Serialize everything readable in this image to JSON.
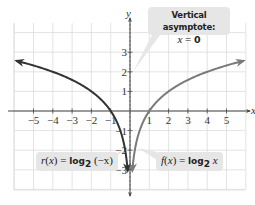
{
  "chart_data": {
    "type": "line",
    "title": "",
    "xlabel": "x",
    "ylabel": "y",
    "xlim": [
      -6,
      6
    ],
    "ylim": [
      -4,
      4
    ],
    "grid": true,
    "x_ticks": [
      -5,
      -4,
      -3,
      -2,
      -1,
      1,
      2,
      3,
      4,
      5
    ],
    "y_ticks": [
      -3,
      -2,
      -1,
      1,
      2,
      3
    ],
    "x_tick_labels": [
      "−5",
      "−4",
      "−3",
      "−2",
      "−1",
      "1",
      "2",
      "3",
      "4",
      "5"
    ],
    "y_tick_labels": [
      "−3",
      "−2",
      "−1",
      "1",
      "2",
      "3"
    ],
    "series": [
      {
        "name": "r(x) = log2(−x)",
        "color": "#333333",
        "x": [
          -5.9,
          -5,
          -4,
          -3,
          -2,
          -1,
          -0.5,
          -0.25,
          -0.125
        ],
        "y": [
          2.56,
          2.32,
          2,
          1.58,
          1,
          0,
          -1,
          -2,
          -3
        ]
      },
      {
        "name": "f(x) = log2 x",
        "color": "#7a7a7a",
        "x": [
          0.125,
          0.25,
          0.5,
          1,
          2,
          3,
          4,
          5,
          5.9
        ],
        "y": [
          -3,
          -2,
          -1,
          0,
          1,
          1.58,
          2,
          2.32,
          2.56
        ]
      }
    ],
    "annotations": [
      {
        "text": "Vertical asymptote: x = 0",
        "x": 0
      },
      {
        "text": "r(x) = log2(−x)",
        "target_series": 0
      },
      {
        "text": "f(x) = log2 x",
        "target_series": 1
      }
    ],
    "legend": "none"
  },
  "axes": {
    "x_label": "x",
    "y_label": "y"
  },
  "callouts": {
    "asymptote_title": "Vertical asymptote:",
    "asymptote_eq_var": "x",
    "asymptote_eq_op": " = ",
    "asymptote_eq_val": "0",
    "r_name": "r",
    "r_paren_open": "(",
    "r_var": "x",
    "r_paren_close": ") = ",
    "r_log": "log",
    "r_base": "2",
    "r_arg": " (−x)",
    "f_name": "f",
    "f_paren_open": "(",
    "f_var": "x",
    "f_paren_close": ") = ",
    "f_log": "log",
    "f_base": "2",
    "f_arg": " x"
  }
}
